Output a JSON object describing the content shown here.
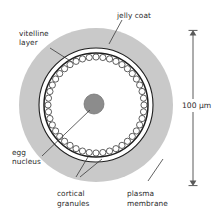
{
  "figure": {
    "title_none": "",
    "background_color": "#ffffff",
    "ink_color": "#2b2b2b",
    "jelly_coat_color": "#c9c9c9",
    "nucleus_color": "#8c8c8c",
    "cytoplasm_color": "#ffffff"
  },
  "labels": {
    "jelly_coat": "jelly coat",
    "vitelline_layer_line1": "vitelline",
    "vitelline_layer_line2": "layer",
    "egg_nucleus_line1": "egg",
    "egg_nucleus_line2": "nucleus",
    "cortical_granules_line1": "cortical",
    "cortical_granules_line2": "granules",
    "plasma_membrane_line1": "plasma",
    "plasma_membrane_line2": "membrane"
  },
  "scale_bar": {
    "value": "100 µm",
    "orientation": "vertical",
    "double_headed": true
  },
  "structure": {
    "center_x": 96,
    "center_y": 105,
    "jelly_coat_radius": 77,
    "vitelline_layer_radius": 57,
    "plasma_membrane_radius": 52,
    "granule_ring_radius": 48,
    "granule_count": 44,
    "granule_radius": 3.1,
    "nucleus_radius": 10
  }
}
